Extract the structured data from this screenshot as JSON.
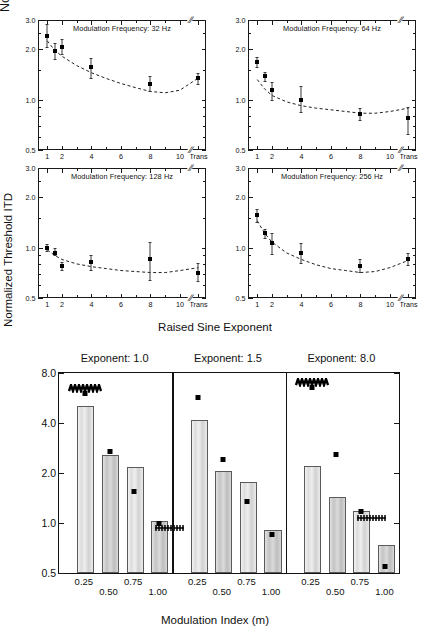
{
  "figure": {
    "top": {
      "ylabel": "Normalized Threshold ITD",
      "xlabel": "Raised Sine Exponent",
      "y_ticks": [
        "3.0",
        "2.0",
        "1.0",
        "0.5"
      ],
      "x_ticks": [
        "1",
        "2",
        "4",
        "6",
        "8",
        "10",
        "Trans"
      ],
      "panels": [
        {
          "title": "Modulation Frequency: 32 Hz"
        },
        {
          "title": "Modulation Frequency: 64 Hz"
        },
        {
          "title": "Modulation Frequency: 128 Hz"
        },
        {
          "title": "Modulation Frequency: 256 Hz"
        }
      ]
    },
    "bottom": {
      "ylabel": "Normalized Threshold ITD",
      "xlabel": "Modulation Index (m)",
      "y_ticks": [
        "8.0",
        "4.0",
        "2.0",
        "1.0",
        "0.5"
      ],
      "x_ticks": [
        "0.25",
        "0.50",
        "0.75",
        "1.00"
      ],
      "group_titles": [
        "Exponent: 1.0",
        "Exponent: 1.5",
        "Exponent: 8.0"
      ]
    }
  },
  "chart_data": [
    {
      "type": "scatter",
      "id": "panel-32hz",
      "title": "Modulation Frequency: 32 Hz",
      "xlabel": "Raised Sine Exponent",
      "ylabel": "Normalized Threshold ITD",
      "yscale": "log",
      "ylim": [
        0.5,
        3.0
      ],
      "yticks": [
        3.0,
        2.0,
        1.0,
        0.5
      ],
      "xticks": [
        1,
        2,
        4,
        6,
        8,
        10,
        "Trans"
      ],
      "axis_break": true,
      "grid": false,
      "x": [
        1,
        1.5,
        2,
        4,
        8,
        "Trans"
      ],
      "y": [
        2.42,
        1.97,
        2.07,
        1.56,
        1.25,
        1.35
      ],
      "yerr_low": [
        0.34,
        0.22,
        0.2,
        0.22,
        0.12,
        0.1
      ],
      "yerr_high": [
        0.4,
        0.2,
        0.23,
        0.22,
        0.13,
        0.1
      ],
      "fit_curve": {
        "x": [
          1,
          1.5,
          2,
          3,
          4,
          5,
          6,
          7,
          8,
          9,
          10,
          "Trans"
        ],
        "y": [
          2.25,
          1.98,
          1.82,
          1.6,
          1.45,
          1.34,
          1.25,
          1.18,
          1.12,
          1.1,
          1.14,
          1.35
        ]
      }
    },
    {
      "type": "scatter",
      "id": "panel-64hz",
      "title": "Modulation Frequency: 64 Hz",
      "xlabel": "Raised Sine Exponent",
      "ylabel": "Normalized Threshold ITD",
      "yscale": "log",
      "ylim": [
        0.5,
        3.0
      ],
      "yticks": [
        3.0,
        2.0,
        1.0,
        0.5
      ],
      "xticks": [
        1,
        2,
        4,
        6,
        8,
        10,
        "Trans"
      ],
      "axis_break": true,
      "grid": false,
      "x": [
        1,
        1.5,
        2,
        4,
        8,
        "Trans"
      ],
      "y": [
        1.68,
        1.38,
        1.14,
        1.0,
        0.82,
        0.78
      ],
      "yerr_low": [
        0.12,
        0.08,
        0.14,
        0.16,
        0.06,
        0.16
      ],
      "yerr_high": [
        0.12,
        0.08,
        0.14,
        0.2,
        0.07,
        0.13
      ],
      "fit_curve": {
        "x": [
          1,
          1.5,
          2,
          3,
          4,
          5,
          6,
          7,
          8,
          9,
          10,
          "Trans"
        ],
        "y": [
          1.32,
          1.16,
          1.06,
          0.97,
          0.92,
          0.89,
          0.87,
          0.85,
          0.83,
          0.83,
          0.85,
          0.89
        ]
      }
    },
    {
      "type": "scatter",
      "id": "panel-128hz",
      "title": "Modulation Frequency: 128 Hz",
      "xlabel": "Raised Sine Exponent",
      "ylabel": "Normalized Threshold ITD",
      "yscale": "log",
      "ylim": [
        0.5,
        3.0
      ],
      "yticks": [
        3.0,
        2.0,
        1.0,
        0.5
      ],
      "xticks": [
        1,
        2,
        4,
        6,
        8,
        10,
        "Trans"
      ],
      "axis_break": true,
      "grid": false,
      "x": [
        1,
        1.5,
        2,
        4,
        8,
        "Trans"
      ],
      "y": [
        0.99,
        0.93,
        0.78,
        0.82,
        0.86,
        0.71
      ],
      "yerr_low": [
        0.03,
        0.03,
        0.04,
        0.08,
        0.22,
        0.08
      ],
      "yerr_high": [
        0.06,
        0.06,
        0.04,
        0.08,
        0.22,
        0.1
      ],
      "fit_curve": {
        "x": [
          1,
          1.5,
          2,
          3,
          4,
          5,
          6,
          7,
          8,
          9,
          10,
          "Trans"
        ],
        "y": [
          0.97,
          0.9,
          0.85,
          0.8,
          0.77,
          0.75,
          0.73,
          0.72,
          0.71,
          0.71,
          0.73,
          0.76
        ]
      }
    },
    {
      "type": "scatter",
      "id": "panel-256hz",
      "title": "Modulation Frequency: 256 Hz",
      "xlabel": "Raised Sine Exponent",
      "ylabel": "Normalized Threshold ITD",
      "yscale": "log",
      "ylim": [
        0.5,
        3.0
      ],
      "yticks": [
        3.0,
        2.0,
        1.0,
        0.5
      ],
      "xticks": [
        1,
        2,
        4,
        6,
        8,
        10,
        "Trans"
      ],
      "axis_break": true,
      "grid": false,
      "x": [
        1,
        1.5,
        2,
        4,
        8,
        "Trans"
      ],
      "y": [
        1.56,
        1.22,
        1.06,
        0.93,
        0.78,
        0.86
      ],
      "yerr_low": [
        0.14,
        0.08,
        0.14,
        0.12,
        0.06,
        0.07
      ],
      "yerr_high": [
        0.14,
        0.08,
        0.16,
        0.14,
        0.08,
        0.07
      ],
      "fit_curve": {
        "x": [
          1,
          1.5,
          2,
          3,
          4,
          5,
          6,
          7,
          8,
          9,
          10,
          "Trans"
        ],
        "y": [
          1.45,
          1.22,
          1.08,
          0.93,
          0.85,
          0.79,
          0.75,
          0.73,
          0.71,
          0.72,
          0.76,
          0.84
        ]
      }
    },
    {
      "type": "bar",
      "id": "bar-panel-exponent-1.0",
      "title": "Exponent: 1.0",
      "xlabel": "Modulation Index (m)",
      "ylabel": "Normalized Threshold ITD",
      "yscale": "log",
      "ylim": [
        0.5,
        8.0
      ],
      "yticks": [
        8.0,
        4.0,
        2.0,
        1.0,
        0.5
      ],
      "categories": [
        "0.25",
        "0.50",
        "0.75",
        "1.00"
      ],
      "values": [
        4.95,
        2.5,
        2.1,
        1.0
      ],
      "overlay_points": [
        6.0,
        2.7,
        1.55,
        1.0
      ],
      "offscale_markers": [
        "0.25"
      ],
      "point_offscale_markers": [
        "1.00"
      ]
    },
    {
      "type": "bar",
      "id": "bar-panel-exponent-1.5",
      "title": "Exponent: 1.5",
      "xlabel": "Modulation Index (m)",
      "ylabel": "Normalized Threshold ITD",
      "yscale": "log",
      "ylim": [
        0.5,
        8.0
      ],
      "yticks": [
        8.0,
        4.0,
        2.0,
        1.0,
        0.5
      ],
      "categories": [
        "0.25",
        "0.50",
        "0.75",
        "1.00"
      ],
      "values": [
        4.05,
        2.0,
        1.72,
        0.88
      ],
      "overlay_points": [
        5.7,
        2.4,
        1.35,
        0.85
      ],
      "offscale_markers": [],
      "point_offscale_markers": []
    },
    {
      "type": "bar",
      "id": "bar-panel-exponent-8.0",
      "title": "Exponent: 8.0",
      "xlabel": "Modulation Index (m)",
      "ylabel": "Normalized Threshold ITD",
      "yscale": "log",
      "ylim": [
        0.5,
        8.0
      ],
      "yticks": [
        8.0,
        4.0,
        2.0,
        1.0,
        0.5
      ],
      "categories": [
        "0.25",
        "0.50",
        "0.75",
        "1.00"
      ],
      "values": [
        2.15,
        1.4,
        1.15,
        0.72
      ],
      "overlay_points": [
        6.5,
        2.6,
        1.18,
        0.55
      ],
      "offscale_markers": [
        "0.25"
      ],
      "point_offscale_markers": [
        "0.75"
      ]
    }
  ]
}
